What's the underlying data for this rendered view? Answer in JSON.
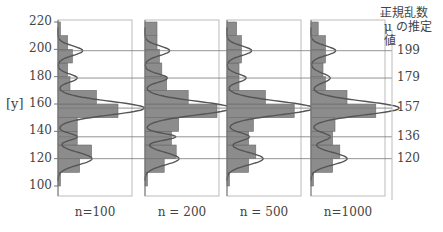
{
  "chart_data": {
    "type": "histogram_with_density",
    "title": "",
    "ylabel": "[y]",
    "y_ticks": [
      100,
      120,
      140,
      160,
      180,
      200,
      220
    ],
    "ylim": [
      100,
      220
    ],
    "bin_width": 10,
    "legend_title_line1": "正規乱数",
    "legend_title_line2": "μ の推定値",
    "mu_estimates": [
      199,
      179,
      157,
      136,
      120
    ],
    "panels": [
      {
        "label": "n=100",
        "n": 100,
        "bins": [
          {
            "lo": 100,
            "hi": 110,
            "count": 1
          },
          {
            "lo": 110,
            "hi": 120,
            "count": 9
          },
          {
            "lo": 120,
            "hi": 130,
            "count": 14
          },
          {
            "lo": 130,
            "hi": 140,
            "count": 8
          },
          {
            "lo": 140,
            "hi": 150,
            "count": 8
          },
          {
            "lo": 150,
            "hi": 160,
            "count": 25
          },
          {
            "lo": 160,
            "hi": 170,
            "count": 16
          },
          {
            "lo": 170,
            "hi": 180,
            "count": 5
          },
          {
            "lo": 180,
            "hi": 190,
            "count": 4
          },
          {
            "lo": 190,
            "hi": 200,
            "count": 6
          },
          {
            "lo": 200,
            "hi": 210,
            "count": 4
          },
          {
            "lo": 210,
            "hi": 220,
            "count": 1
          }
        ]
      },
      {
        "label": "n = 200",
        "n": 200,
        "bins": [
          {
            "lo": 100,
            "hi": 110,
            "count": 1
          },
          {
            "lo": 110,
            "hi": 120,
            "count": 8
          },
          {
            "lo": 120,
            "hi": 130,
            "count": 13
          },
          {
            "lo": 130,
            "hi": 140,
            "count": 11
          },
          {
            "lo": 140,
            "hi": 150,
            "count": 14
          },
          {
            "lo": 150,
            "hi": 160,
            "count": 30
          },
          {
            "lo": 160,
            "hi": 170,
            "count": 18
          },
          {
            "lo": 170,
            "hi": 180,
            "count": 9
          },
          {
            "lo": 180,
            "hi": 190,
            "count": 7
          },
          {
            "lo": 190,
            "hi": 200,
            "count": 6
          },
          {
            "lo": 200,
            "hi": 210,
            "count": 5
          },
          {
            "lo": 210,
            "hi": 220,
            "count": 5
          }
        ]
      },
      {
        "label": "n = 500",
        "n": 500,
        "bins": [
          {
            "lo": 100,
            "hi": 110,
            "count": 1
          },
          {
            "lo": 110,
            "hi": 120,
            "count": 9
          },
          {
            "lo": 120,
            "hi": 130,
            "count": 12
          },
          {
            "lo": 130,
            "hi": 140,
            "count": 9
          },
          {
            "lo": 140,
            "hi": 150,
            "count": 11
          },
          {
            "lo": 150,
            "hi": 160,
            "count": 28
          },
          {
            "lo": 160,
            "hi": 170,
            "count": 16
          },
          {
            "lo": 170,
            "hi": 180,
            "count": 5
          },
          {
            "lo": 180,
            "hi": 190,
            "count": 5
          },
          {
            "lo": 190,
            "hi": 200,
            "count": 6
          },
          {
            "lo": 200,
            "hi": 210,
            "count": 6
          },
          {
            "lo": 210,
            "hi": 220,
            "count": 4
          }
        ]
      },
      {
        "label": "n=1000",
        "n": 1000,
        "bins": [
          {
            "lo": 100,
            "hi": 110,
            "count": 1
          },
          {
            "lo": 110,
            "hi": 120,
            "count": 9
          },
          {
            "lo": 120,
            "hi": 130,
            "count": 12
          },
          {
            "lo": 130,
            "hi": 140,
            "count": 9
          },
          {
            "lo": 140,
            "hi": 150,
            "count": 10
          },
          {
            "lo": 150,
            "hi": 160,
            "count": 27
          },
          {
            "lo": 160,
            "hi": 170,
            "count": 15
          },
          {
            "lo": 170,
            "hi": 180,
            "count": 6
          },
          {
            "lo": 180,
            "hi": 190,
            "count": 5
          },
          {
            "lo": 190,
            "hi": 200,
            "count": 6
          },
          {
            "lo": 200,
            "hi": 210,
            "count": 6
          },
          {
            "lo": 210,
            "hi": 220,
            "count": 3
          }
        ]
      }
    ],
    "density_components": {
      "n=100": [
        {
          "mu": 120,
          "sd": 4.5,
          "w": 0.16
        },
        {
          "mu": 136,
          "sd": 2.5,
          "w": 0.05
        },
        {
          "mu": 157,
          "sd": 5,
          "w": 0.45
        },
        {
          "mu": 179,
          "sd": 3,
          "w": 0.06
        },
        {
          "mu": 199,
          "sd": 3.5,
          "w": 0.09
        }
      ],
      "n = 200": [
        {
          "mu": 120,
          "sd": 4.5,
          "w": 0.16
        },
        {
          "mu": 136,
          "sd": 2.5,
          "w": 0.08
        },
        {
          "mu": 157,
          "sd": 5,
          "w": 0.45
        },
        {
          "mu": 179,
          "sd": 3,
          "w": 0.07
        },
        {
          "mu": 199,
          "sd": 3.5,
          "w": 0.09
        }
      ],
      "n = 500": [
        {
          "mu": 120,
          "sd": 4.5,
          "w": 0.17
        },
        {
          "mu": 136,
          "sd": 3,
          "w": 0.07
        },
        {
          "mu": 157,
          "sd": 5,
          "w": 0.45
        },
        {
          "mu": 179,
          "sd": 3,
          "w": 0.06
        },
        {
          "mu": 199,
          "sd": 3.5,
          "w": 0.09
        }
      ],
      "n=1000": [
        {
          "mu": 120,
          "sd": 4.5,
          "w": 0.17
        },
        {
          "mu": 136,
          "sd": 3,
          "w": 0.06
        },
        {
          "mu": 157,
          "sd": 5,
          "w": 0.46
        },
        {
          "mu": 179,
          "sd": 3.5,
          "w": 0.07
        },
        {
          "mu": 199,
          "sd": 3.5,
          "w": 0.09
        }
      ]
    },
    "colors": {
      "bar": "#8c8c8c",
      "curve": "#555555",
      "line": "#777777",
      "frame": "#bbbbbb"
    }
  }
}
